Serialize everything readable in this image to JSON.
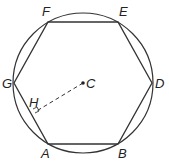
{
  "diagram": {
    "labels": {
      "F": "F",
      "E": "E",
      "D": "D",
      "B": "B",
      "A": "A",
      "G": "G",
      "C": "C",
      "H": "H"
    },
    "elements": {
      "circle": "circumscribed circle centered at C",
      "hexagon": "regular hexagon ABDEFG",
      "apothem": "dashed segment CH perpendicular to GA with right-angle mark at H"
    },
    "colors": {
      "stroke": "#333333",
      "background": "#ffffff"
    }
  }
}
